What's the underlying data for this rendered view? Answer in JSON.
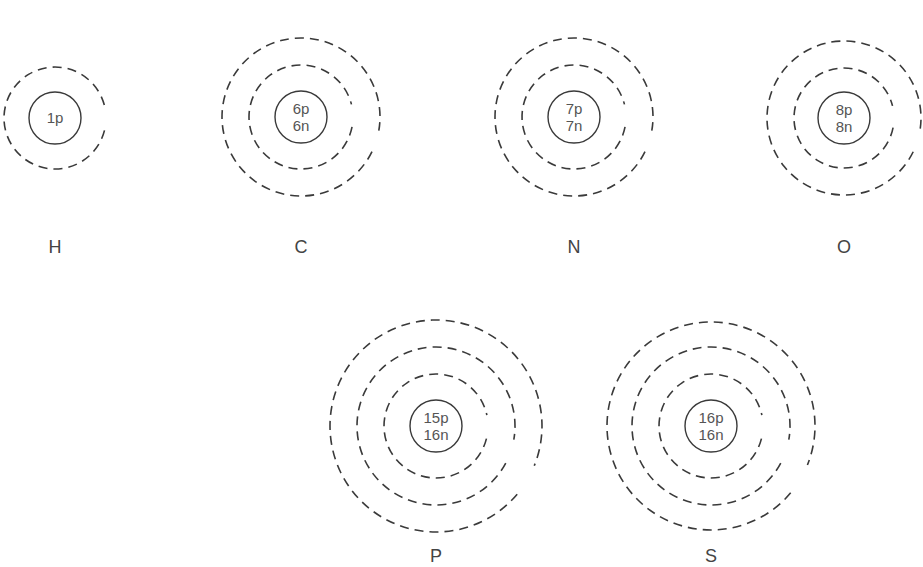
{
  "colors": {
    "stroke": "#3a3a3a",
    "text": "#555555",
    "label": "#444444",
    "background": "#ffffff"
  },
  "atoms": [
    {
      "symbol": "H",
      "nucleus": [
        "1p"
      ],
      "cx": 55,
      "cy": 118,
      "nucleus_r": 26,
      "shells": [
        {
          "r": 51,
          "gap_start": -8,
          "gap_end": 14
        }
      ],
      "label_y": 253
    },
    {
      "symbol": "C",
      "nucleus": [
        "6p",
        "6n"
      ],
      "cx": 301,
      "cy": 117,
      "nucleus_r": 26,
      "shells": [
        {
          "r": 52,
          "gap_start": -14,
          "gap_end": 11
        },
        {
          "r": 79,
          "gap_start": 10,
          "gap_end": 26
        }
      ],
      "label_y": 253
    },
    {
      "symbol": "N",
      "nucleus": [
        "7p",
        "7n"
      ],
      "cx": 574,
      "cy": 117,
      "nucleus_r": 26,
      "shells": [
        {
          "r": 52,
          "gap_start": -14,
          "gap_end": 11
        },
        {
          "r": 79,
          "gap_start": 10,
          "gap_end": 26
        }
      ],
      "label_y": 253
    },
    {
      "symbol": "O",
      "nucleus": [
        "8p",
        "8n"
      ],
      "cx": 844,
      "cy": 118,
      "nucleus_r": 26,
      "shells": [
        {
          "r": 50,
          "gap_start": -14,
          "gap_end": 11
        },
        {
          "r": 77,
          "gap_start": 10,
          "gap_end": 26
        }
      ],
      "label_y": 253
    },
    {
      "symbol": "P",
      "nucleus": [
        "15p",
        "16n"
      ],
      "cx": 436,
      "cy": 426,
      "nucleus_r": 26,
      "shells": [
        {
          "r": 52,
          "gap_start": -12,
          "gap_end": 14
        },
        {
          "r": 79,
          "gap_start": 10,
          "gap_end": 28
        },
        {
          "r": 106,
          "gap_start": 22,
          "gap_end": 40
        }
      ],
      "label_y": 562
    },
    {
      "symbol": "S",
      "nucleus": [
        "16p",
        "16n"
      ],
      "cx": 711,
      "cy": 426,
      "nucleus_r": 26,
      "shells": [
        {
          "r": 52,
          "gap_start": -12,
          "gap_end": 14
        },
        {
          "r": 79,
          "gap_start": 10,
          "gap_end": 28
        },
        {
          "r": 104,
          "gap_start": 22,
          "gap_end": 40
        }
      ],
      "label_y": 562
    }
  ]
}
